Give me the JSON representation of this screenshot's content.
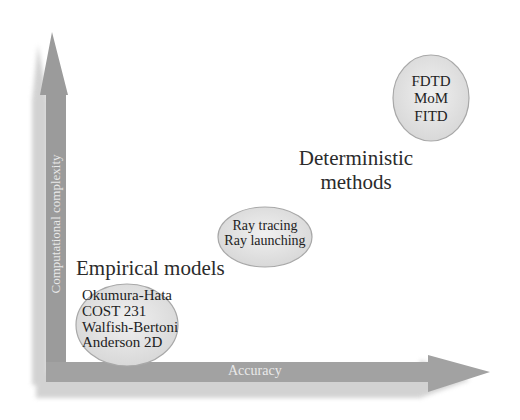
{
  "diagram": {
    "axes": {
      "y_label": "Computational complexity",
      "x_label": "Accuracy",
      "arrow_color": "#9a9a9a"
    },
    "groups": [
      {
        "heading": "Empirical models",
        "items": [
          "Okumura-Hata",
          "COST 231",
          "Walfish-Bertoni",
          "Anderson 2D"
        ]
      },
      {
        "heading": "",
        "items": [
          "Ray tracing",
          "Ray launching"
        ]
      },
      {
        "heading": "Deterministic methods",
        "heading_lines": [
          "Deterministic",
          "methods"
        ],
        "items": [
          "FDTD",
          "MoM",
          "FITD"
        ]
      }
    ],
    "ellipse_fill": "#e4e4e4",
    "ellipse_stroke": "#a8a8a8"
  }
}
